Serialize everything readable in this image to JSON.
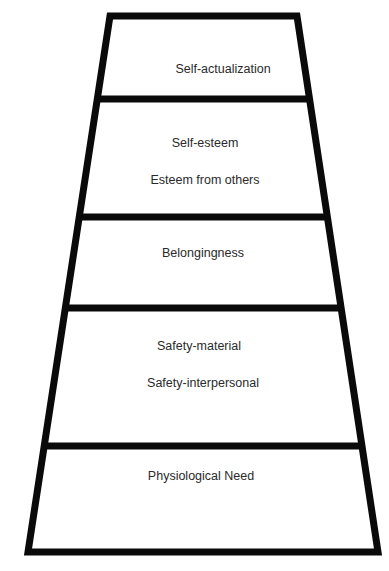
{
  "diagram": {
    "type": "hierarchy-pyramid",
    "colors": {
      "stroke": "#0a0a0a",
      "fill": "#ffffff",
      "text": "#2a2a2a"
    },
    "levels": [
      {
        "name": "self-actualization",
        "lines": [
          "Self-actualization"
        ]
      },
      {
        "name": "esteem",
        "lines": [
          "Self-esteem",
          "Esteem from others"
        ]
      },
      {
        "name": "belongingness",
        "lines": [
          "Belongingness"
        ]
      },
      {
        "name": "safety",
        "lines": [
          "Safety-material",
          "Safety-interpersonal"
        ]
      },
      {
        "name": "physiological",
        "lines": [
          "Physiological Need"
        ]
      }
    ]
  }
}
